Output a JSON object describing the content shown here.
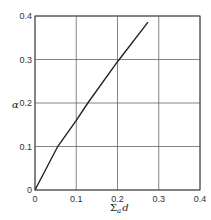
{
  "chart_data": {
    "type": "line",
    "title": "",
    "xlabel": "Σ_a d",
    "ylabel": "α",
    "xlim": [
      0,
      0.4
    ],
    "ylim": [
      0,
      0.4
    ],
    "grid": true,
    "legend": null,
    "x_ticks": [
      "0",
      "0.1",
      "0.2",
      "0.3",
      "0.4"
    ],
    "y_ticks": [
      "0",
      "0.1",
      "0.2",
      "0.3",
      "0.4"
    ],
    "series": [
      {
        "name": "α vs Σ_a d",
        "x": [
          0,
          0.055,
          0.1,
          0.128,
          0.2,
          0.274
        ],
        "y": [
          0,
          0.1,
          0.16,
          0.2,
          0.295,
          0.386
        ]
      }
    ]
  },
  "labels": {
    "xlabel_main": "Σ",
    "xlabel_sub": "a",
    "xlabel_tail": "d",
    "ylabel": "α"
  }
}
